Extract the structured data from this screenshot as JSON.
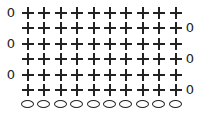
{
  "diagram": {
    "type": "crochet-chart",
    "stitch_symbols": {
      "plus": "single crochet",
      "oval": "chain",
      "zero": "turning chain"
    },
    "stitches_per_row": 10,
    "rows": [
      {
        "row": 1,
        "turn_side": "left",
        "turn_label": "0"
      },
      {
        "row": 2,
        "turn_side": "right",
        "turn_label": "0"
      },
      {
        "row": 3,
        "turn_side": "left",
        "turn_label": "0"
      },
      {
        "row": 4,
        "turn_side": "right",
        "turn_label": "0"
      },
      {
        "row": 5,
        "turn_side": "left",
        "turn_label": "0"
      },
      {
        "row": 6,
        "turn_side": "right",
        "turn_label": "0"
      }
    ],
    "foundation_chain_count": 10
  }
}
